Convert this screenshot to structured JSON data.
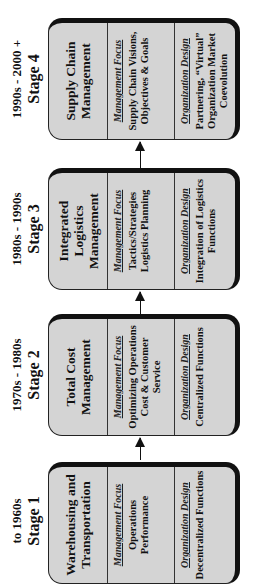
{
  "stages": [
    {
      "era": "to 1960s",
      "stage": "Stage 1",
      "title": "Warehousing and Transportation",
      "focus_label": "Management Focus",
      "focus": "Operations Performance",
      "design_label": "Organization Design",
      "design": "Decentralized Functions"
    },
    {
      "era": "1970s - 1980s",
      "stage": "Stage 2",
      "title": "Total Cost Management",
      "focus_label": "Management Focus",
      "focus": "Optimizing Operations Cost & Customer Service",
      "design_label": "Organization Design",
      "design": "Centralized Functions"
    },
    {
      "era": "1980s - 1990s",
      "stage": "Stage 3",
      "title": "Integrated Logistics Management",
      "focus_label": "Management Focus",
      "focus": "Tactics/Strategies Logistics Planning",
      "design_label": "Organization Design",
      "design": "Integration of Logistics Functions"
    },
    {
      "era": "1990s - 2000 +",
      "stage": "Stage 4",
      "title": "Supply Chain Management",
      "focus_label": "Management Focus",
      "focus": "Supply Chain Visions, Objectives & Goals",
      "design_label": "Organization Design",
      "design": "Partnering, “Virtual” Organization Market Coevolution"
    }
  ],
  "colors": {
    "box_fill": "#d4d4d4",
    "border": "#111111",
    "background": "#ffffff"
  }
}
